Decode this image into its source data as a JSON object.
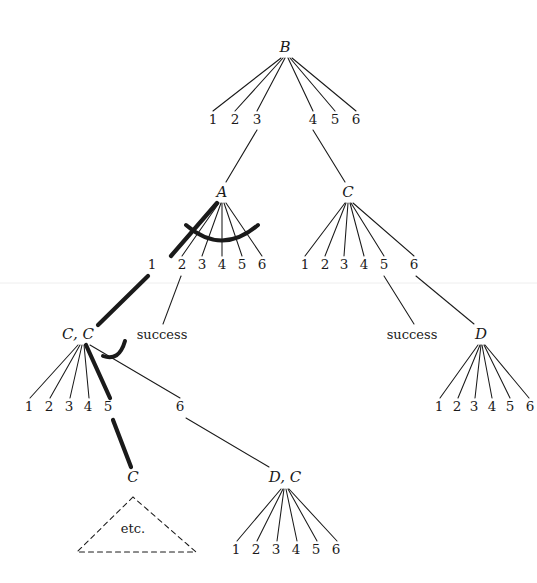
{
  "figure": {
    "type": "search-tree-diagram",
    "background_color": "#ffffff",
    "ink_color": "#1a1a1a",
    "width": 537,
    "height": 583
  },
  "nodes": [
    {
      "id": "B",
      "label": "B",
      "x": 285,
      "y": 47
    },
    {
      "id": "A",
      "label": "A",
      "x": 222,
      "y": 192
    },
    {
      "id": "C",
      "label": "C",
      "x": 348,
      "y": 192
    },
    {
      "id": "CC",
      "label": "C, C",
      "x": 78,
      "y": 334
    },
    {
      "id": "D",
      "label": "D",
      "x": 481,
      "y": 334
    },
    {
      "id": "C2",
      "label": "C",
      "x": 133,
      "y": 477
    },
    {
      "id": "DC",
      "label": "D, C",
      "x": 285,
      "y": 477
    }
  ],
  "moves": {
    "B": [
      {
        "n": "1",
        "x": 213,
        "y": 120
      },
      {
        "n": "2",
        "x": 235,
        "y": 120
      },
      {
        "n": "3",
        "x": 257,
        "y": 120
      },
      {
        "n": "4",
        "x": 313,
        "y": 120
      },
      {
        "n": "5",
        "x": 335,
        "y": 120
      },
      {
        "n": "6",
        "x": 356,
        "y": 120
      }
    ],
    "A": [
      {
        "n": "1",
        "x": 152,
        "y": 265
      },
      {
        "n": "2",
        "x": 182,
        "y": 265
      },
      {
        "n": "3",
        "x": 202,
        "y": 265
      },
      {
        "n": "4",
        "x": 222,
        "y": 265
      },
      {
        "n": "5",
        "x": 242,
        "y": 265
      },
      {
        "n": "6",
        "x": 262,
        "y": 265
      }
    ],
    "C": [
      {
        "n": "1",
        "x": 305,
        "y": 265
      },
      {
        "n": "2",
        "x": 325,
        "y": 265
      },
      {
        "n": "3",
        "x": 344,
        "y": 265
      },
      {
        "n": "4",
        "x": 364,
        "y": 265
      },
      {
        "n": "5",
        "x": 384,
        "y": 265
      },
      {
        "n": "6",
        "x": 414,
        "y": 265
      }
    ],
    "CC": [
      {
        "n": "1",
        "x": 29,
        "y": 407
      },
      {
        "n": "2",
        "x": 49,
        "y": 407
      },
      {
        "n": "3",
        "x": 69,
        "y": 407
      },
      {
        "n": "4",
        "x": 88,
        "y": 407
      },
      {
        "n": "5",
        "x": 108,
        "y": 407
      },
      {
        "n": "6",
        "x": 180,
        "y": 407
      }
    ],
    "D": [
      {
        "n": "1",
        "x": 439,
        "y": 407
      },
      {
        "n": "2",
        "x": 457,
        "y": 407
      },
      {
        "n": "3",
        "x": 474,
        "y": 407
      },
      {
        "n": "4",
        "x": 492,
        "y": 407
      },
      {
        "n": "5",
        "x": 510,
        "y": 407
      },
      {
        "n": "6",
        "x": 530,
        "y": 407
      }
    ],
    "DC": [
      {
        "n": "1",
        "x": 236,
        "y": 550
      },
      {
        "n": "2",
        "x": 256,
        "y": 550
      },
      {
        "n": "3",
        "x": 276,
        "y": 550
      },
      {
        "n": "4",
        "x": 296,
        "y": 550
      },
      {
        "n": "5",
        "x": 316,
        "y": 550
      },
      {
        "n": "6",
        "x": 336,
        "y": 550
      }
    ]
  },
  "annotations": [
    {
      "id": "success-left",
      "text": "success",
      "x": 162,
      "y": 334
    },
    {
      "id": "success-right",
      "text": "success",
      "x": 412,
      "y": 334
    },
    {
      "id": "etc",
      "text": "etc.",
      "x": 133,
      "y": 528
    }
  ],
  "etc_triangle": {
    "apex_x": 133,
    "apex_y": 497,
    "left_x": 77,
    "base_y": 552,
    "right_x": 196,
    "style": "dashed"
  }
}
